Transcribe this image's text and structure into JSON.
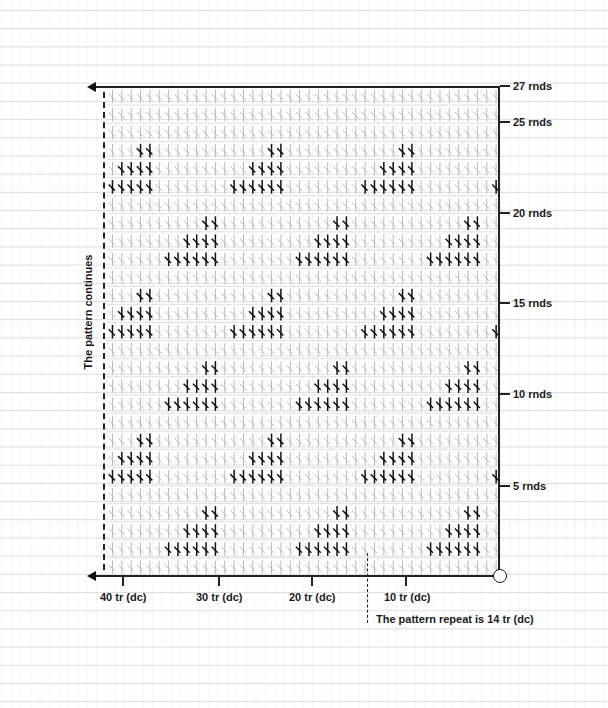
{
  "chart_data": {
    "type": "table",
    "stitch_symbol": "tr (dc)",
    "rounds": 27,
    "stitches_per_round": 42,
    "repeat_stitches": 14,
    "row_labels": [
      {
        "round": 5,
        "label": "5 rnds"
      },
      {
        "round": 10,
        "label": "10 rnds"
      },
      {
        "round": 15,
        "label": "15 rnds"
      },
      {
        "round": 20,
        "label": "20 rnds"
      },
      {
        "round": 25,
        "label": "25 rnds"
      },
      {
        "round": 27,
        "label": "27 rnds"
      }
    ],
    "column_labels": [
      {
        "stitch": 10,
        "label": "10 tr (dc)"
      },
      {
        "stitch": 20,
        "label": "20 tr (dc)"
      },
      {
        "stitch": 30,
        "label": "30 tr (dc)"
      },
      {
        "stitch": 40,
        "label": "40 tr (dc)"
      }
    ],
    "motif_note": "Highlighted (dark) stitches form stepped triangles: 6, 4, 2 stitches over three rounds, then 1 plain round; each 4-round band shifts 7 stitches. Dark stitch positions are counted from the right (1 = first stitch).",
    "highlighted_stitches_by_round": {
      "2": [
        3,
        4,
        5,
        6,
        7,
        8,
        17,
        18,
        19,
        20,
        21,
        22,
        31,
        32,
        33,
        34,
        35,
        36
      ],
      "3": [
        3,
        4,
        5,
        6,
        17,
        18,
        19,
        20,
        31,
        32,
        33,
        34
      ],
      "4": [
        3,
        4,
        17,
        18,
        31,
        32
      ],
      "6": [
        1,
        10,
        11,
        12,
        13,
        14,
        15,
        24,
        25,
        26,
        27,
        28,
        29,
        38,
        39,
        40,
        41,
        42
      ],
      "7": [
        10,
        11,
        12,
        13,
        24,
        25,
        26,
        27,
        38,
        39,
        40,
        41
      ],
      "8": [
        10,
        11,
        24,
        25,
        38,
        39
      ],
      "10": [
        3,
        4,
        5,
        6,
        7,
        8,
        17,
        18,
        19,
        20,
        21,
        22,
        31,
        32,
        33,
        34,
        35,
        36
      ],
      "11": [
        3,
        4,
        5,
        6,
        17,
        18,
        19,
        20,
        31,
        32,
        33,
        34
      ],
      "12": [
        3,
        4,
        17,
        18,
        31,
        32
      ],
      "14": [
        1,
        10,
        11,
        12,
        13,
        14,
        15,
        24,
        25,
        26,
        27,
        28,
        29,
        38,
        39,
        40,
        41,
        42
      ],
      "15": [
        10,
        11,
        12,
        13,
        24,
        25,
        26,
        27,
        38,
        39,
        40,
        41
      ],
      "16": [
        10,
        11,
        24,
        25,
        38,
        39
      ],
      "18": [
        3,
        4,
        5,
        6,
        7,
        8,
        17,
        18,
        19,
        20,
        21,
        22,
        31,
        32,
        33,
        34,
        35,
        36
      ],
      "19": [
        3,
        4,
        5,
        6,
        17,
        18,
        19,
        20,
        31,
        32,
        33,
        34
      ],
      "20": [
        3,
        4,
        17,
        18,
        31,
        32
      ],
      "22": [
        1,
        10,
        11,
        12,
        13,
        14,
        15,
        24,
        25,
        26,
        27,
        28,
        29,
        38,
        39,
        40,
        41,
        42
      ],
      "23": [
        10,
        11,
        12,
        13,
        24,
        25,
        26,
        27,
        38,
        39,
        40,
        41
      ],
      "24": [
        10,
        11,
        24,
        25,
        38,
        39
      ]
    }
  },
  "labels": {
    "side": "The pattern continues",
    "repeat_note": "The pattern repeat is 14 tr (dc)",
    "rounds": {
      "r27": "27 rnds",
      "r25": "25 rnds",
      "r20": "20 rnds",
      "r15": "15 rnds",
      "r10": "10 rnds",
      "r5": "5 rnds"
    },
    "stitches": {
      "s40": "40 tr (dc)",
      "s30": "30 tr (dc)",
      "s20": "20 tr (dc)",
      "s10": "10 tr (dc)"
    }
  },
  "colors": {
    "light_stitch": "#b9b9b9",
    "dark_stitch": "#111111",
    "axis": "#222222"
  }
}
